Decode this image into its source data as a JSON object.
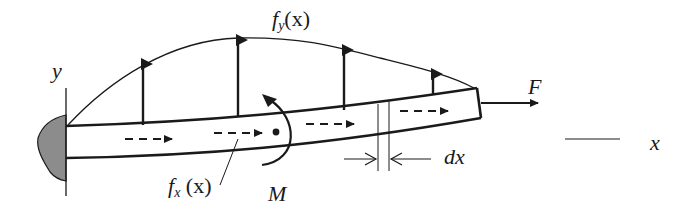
{
  "diagram": {
    "title": "",
    "type": "cantilever beam with distributed loads",
    "labels": {
      "y_axis": "y",
      "x_axis": "x",
      "distributed_transverse_load": {
        "base": "f",
        "sub": "y",
        "arg": "(x)"
      },
      "distributed_axial_load": {
        "base": "f",
        "sub": "x",
        "arg": " (x)"
      },
      "moment": "M",
      "end_force": "F",
      "differential_element": "dx"
    },
    "colors": {
      "stroke": "#1a1a1a",
      "support_fill": "#8c8c8c",
      "background": "#ffffff"
    },
    "elements": [
      {
        "id": "support",
        "kind": "fixed wall with shaded blob"
      },
      {
        "id": "beam",
        "kind": "slightly curved beam, fixed left end, free right end"
      },
      {
        "id": "fy-curve",
        "kind": "distributed load envelope above beam"
      },
      {
        "id": "fy-arrows",
        "count": 4,
        "direction": "up"
      },
      {
        "id": "fx-arrows",
        "count": 4,
        "direction": "right",
        "style": "dashed"
      },
      {
        "id": "moment",
        "direction": "counter-clockwise"
      },
      {
        "id": "force-F",
        "direction": "right"
      },
      {
        "id": "dx-element",
        "kind": "two vertical lines with inward arrows"
      }
    ]
  }
}
